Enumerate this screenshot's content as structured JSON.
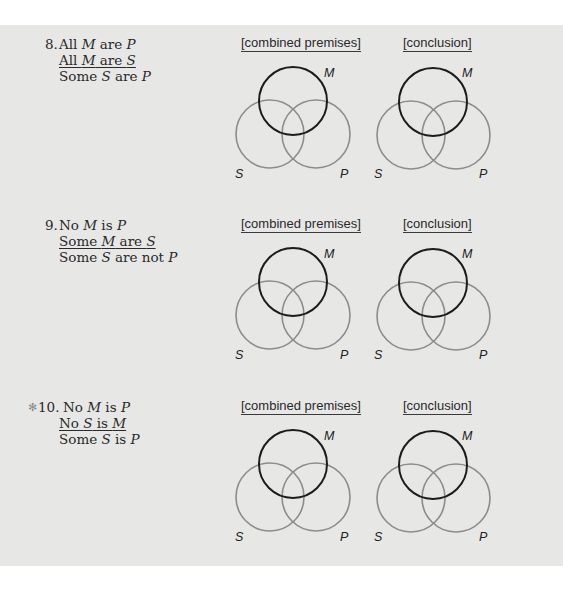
{
  "headers": {
    "combined": "[combined premises]",
    "conclusion": "[conclusion]"
  },
  "labels": {
    "M": "M",
    "S": "S",
    "P": "P"
  },
  "colors": {
    "background": "#e7e7e6",
    "middle_term_circle": "#1c1c1c",
    "other_circles": "#8c8c8c",
    "star": "#8a8a8a"
  },
  "exercises": [
    {
      "number": "8.",
      "starred": false,
      "premise1": [
        "All ",
        "M",
        " are ",
        "P"
      ],
      "premise2": [
        "All ",
        "M",
        " are ",
        "S"
      ],
      "conclusion": [
        "Some ",
        "S",
        " are ",
        "P"
      ]
    },
    {
      "number": "9.",
      "starred": false,
      "premise1": [
        "No ",
        "M",
        " is ",
        "P"
      ],
      "premise2": [
        "Some ",
        "M",
        " are ",
        "S"
      ],
      "conclusion": [
        "Some ",
        "S",
        " are not ",
        "P"
      ]
    },
    {
      "number": "10.",
      "star_glyph": "✻",
      "starred": true,
      "premise1": [
        "No ",
        "M",
        " is ",
        "P"
      ],
      "premise2": [
        "No ",
        "S",
        " is ",
        "M"
      ],
      "conclusion": [
        "Some ",
        "S",
        " is ",
        "P"
      ]
    }
  ]
}
